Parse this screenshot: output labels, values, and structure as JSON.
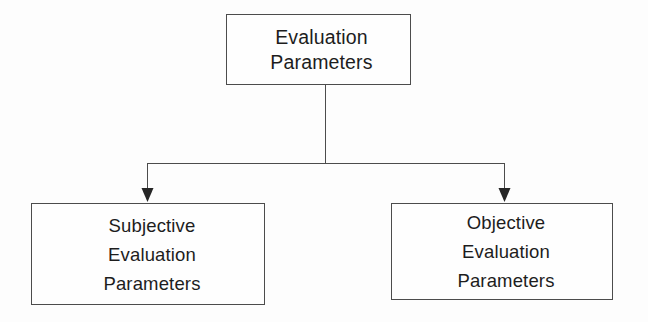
{
  "diagram": {
    "type": "tree-diagram",
    "orientation": "top-down",
    "background_color": "#fdfdfd",
    "line_color": "#4c4c4c",
    "text_color": "#1d1d1d",
    "nodes": [
      {
        "id": "root",
        "role": "parent",
        "lines": [
          "Evaluation",
          "Parameters"
        ],
        "line1": "Evaluation",
        "line2": "Parameters"
      },
      {
        "id": "subjective",
        "role": "child-left",
        "lines": [
          "Subjective",
          "Evaluation",
          "Parameters"
        ],
        "line1": "Subjective",
        "line2": "Evaluation",
        "line3": "Parameters"
      },
      {
        "id": "objective",
        "role": "child-right",
        "lines": [
          "Objective",
          "Evaluation",
          "Parameters"
        ],
        "line1": "Objective",
        "line2": "Evaluation",
        "line3": "Parameters"
      }
    ],
    "connectors": [
      {
        "id": "root-to-branch",
        "from": "root",
        "to": "branch-bar",
        "arrow": false
      },
      {
        "id": "branch-to-subjective",
        "from": "branch-bar",
        "to": "subjective",
        "arrow": true
      },
      {
        "id": "branch-to-objective",
        "from": "branch-bar",
        "to": "objective",
        "arrow": true
      }
    ]
  }
}
